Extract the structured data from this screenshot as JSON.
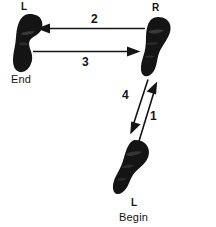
{
  "diagram": {
    "background_color": "#ffffff",
    "ink_color": "#141414",
    "feet": [
      {
        "id": "foot-left-end",
        "side_label": "L",
        "terminus_label": "End",
        "position": "upper-left"
      },
      {
        "id": "foot-right",
        "side_label": "R",
        "terminus_label": "",
        "position": "upper-right"
      },
      {
        "id": "foot-left-begin",
        "side_label": "L",
        "terminus_label": "Begin",
        "position": "lower-center"
      }
    ],
    "arrows": [
      {
        "id": "arrow-1",
        "number": "1",
        "from": "foot-left-begin",
        "to": "foot-right",
        "direction": "up-right"
      },
      {
        "id": "arrow-2",
        "number": "2",
        "from": "foot-right",
        "to": "foot-left-end",
        "direction": "left"
      },
      {
        "id": "arrow-3",
        "number": "3",
        "from": "foot-left-end",
        "to": "foot-right",
        "direction": "right"
      },
      {
        "id": "arrow-4",
        "number": "4",
        "from": "foot-right",
        "to": "foot-left-begin",
        "direction": "down-left"
      }
    ]
  }
}
